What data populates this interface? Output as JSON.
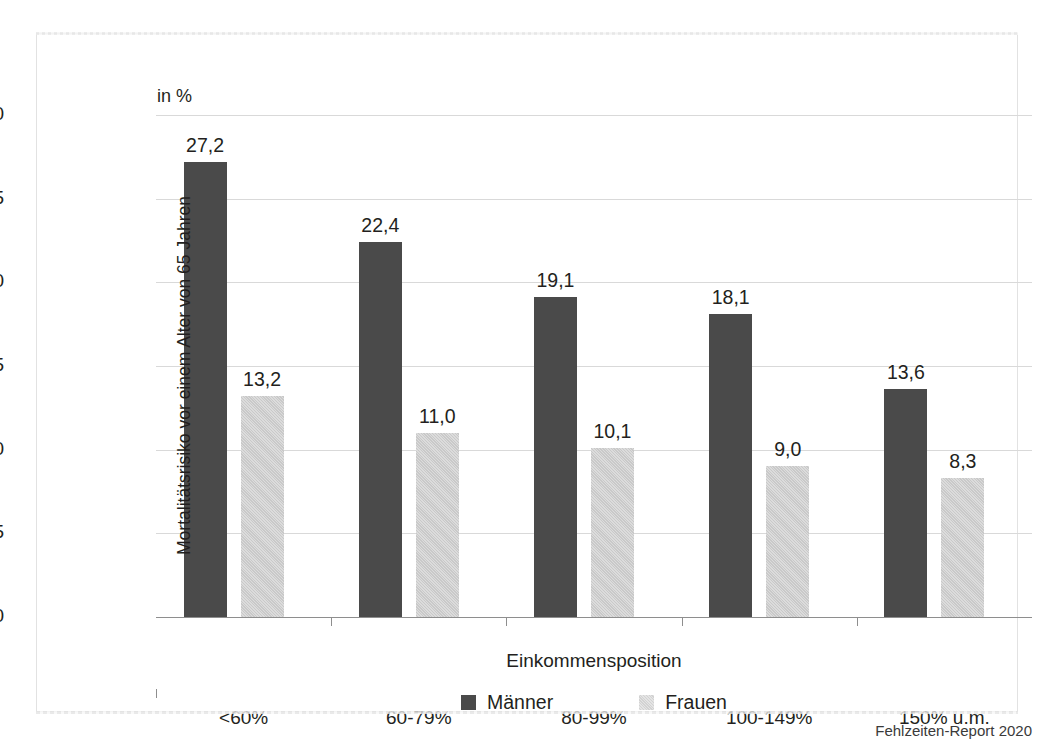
{
  "chart_data": {
    "type": "bar",
    "title": "",
    "unit_label": "in %",
    "xlabel": "Einkommensposition",
    "ylabel": "Mortalitätsrisiko vor einem Alter von 65 Jahren",
    "categories": [
      "<60%",
      "60-79%",
      "80-99%",
      "100-149%",
      "150% u.m."
    ],
    "series": [
      {
        "name": "Männer",
        "color": "#4a4a4a",
        "values": [
          27.2,
          22.4,
          19.1,
          18.1,
          13.6
        ],
        "value_labels": [
          "27,2",
          "22,4",
          "19,1",
          "18,1",
          "13,6"
        ]
      },
      {
        "name": "Frauen",
        "color": "#c9c9c9",
        "values": [
          13.2,
          11.0,
          10.1,
          9.0,
          8.3
        ],
        "value_labels": [
          "13,2",
          "11,0",
          "10,1",
          "9,0",
          "8,3"
        ]
      }
    ],
    "ylim": [
      0,
      30
    ],
    "yticks": [
      0,
      5,
      10,
      15,
      20,
      25,
      30
    ],
    "ytick_labels": [
      "0",
      "5",
      "10",
      "15",
      "20",
      "25",
      "30"
    ],
    "grid": true,
    "legend_position": "bottom-center"
  },
  "footer": {
    "source": "Fehlzeiten-Report 2020"
  }
}
